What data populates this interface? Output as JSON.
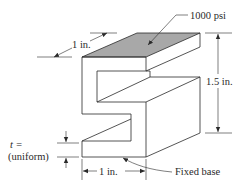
{
  "diagram": {
    "type": "engineering-isometric-drawing",
    "colors": {
      "line": "#2a2a2a",
      "top_face_fill": "#a8a8a8",
      "background": "#ffffff"
    },
    "labels": {
      "pressure": "1000 psi",
      "depth": "1 in.",
      "height": "1.5 in.",
      "thickness_symbol": "t =",
      "thickness_note": "(uniform)",
      "width": "1 in.",
      "base": "Fixed base"
    }
  }
}
